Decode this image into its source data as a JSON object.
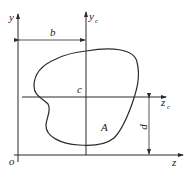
{
  "diagram": {
    "title": "",
    "labels": {
      "y_axis": "y",
      "yc_axis": "y",
      "yc_sub": "c",
      "z_axis": "z",
      "zc_axis": "z",
      "zc_sub": "c",
      "origin": "o",
      "centroid": "c",
      "area": "A",
      "dim_b": "b",
      "dim_d": "d"
    },
    "colors": {
      "line": "#2a2a2a",
      "background": "#ffffff"
    }
  }
}
